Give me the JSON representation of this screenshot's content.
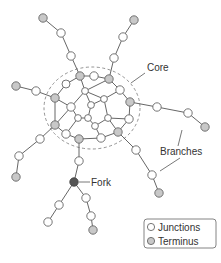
{
  "labels": {
    "core": "Core",
    "branches": "Branches",
    "fork": "Fork"
  },
  "legend": {
    "items": [
      {
        "label": "Junctions",
        "type": "junction"
      },
      {
        "label": "Terminus",
        "type": "terminus"
      }
    ]
  },
  "colors": {
    "junction_fill": "#ffffff",
    "terminus_fill": "#c8c8c8",
    "fork_fill": "#555555",
    "stroke": "#666666"
  },
  "nodes": [
    {
      "id": "t1",
      "x": 43,
      "y": 18,
      "type": "terminus"
    },
    {
      "id": "a1",
      "x": 61,
      "y": 33,
      "type": "junction"
    },
    {
      "id": "a2",
      "x": 71,
      "y": 56,
      "type": "junction"
    },
    {
      "id": "c1",
      "x": 80,
      "y": 76,
      "type": "terminus"
    },
    {
      "id": "t2",
      "x": 134,
      "y": 20,
      "type": "terminus"
    },
    {
      "id": "b1",
      "x": 123,
      "y": 37,
      "type": "junction"
    },
    {
      "id": "b2",
      "x": 114,
      "y": 58,
      "type": "junction"
    },
    {
      "id": "c2",
      "x": 109,
      "y": 79,
      "type": "terminus"
    },
    {
      "id": "c3",
      "x": 94,
      "y": 76,
      "type": "junction"
    },
    {
      "id": "t3",
      "x": 16,
      "y": 86,
      "type": "terminus"
    },
    {
      "id": "d1",
      "x": 36,
      "y": 91,
      "type": "junction"
    },
    {
      "id": "c4",
      "x": 55,
      "y": 98,
      "type": "terminus"
    },
    {
      "id": "c5",
      "x": 85,
      "y": 91,
      "type": "junction"
    },
    {
      "id": "c6",
      "x": 104,
      "y": 99,
      "type": "junction"
    },
    {
      "id": "c7",
      "x": 120,
      "y": 90,
      "type": "junction"
    },
    {
      "id": "c8",
      "x": 71,
      "y": 107,
      "type": "junction"
    },
    {
      "id": "c9",
      "x": 91,
      "y": 105,
      "type": "junction"
    },
    {
      "id": "c10",
      "x": 130,
      "y": 102,
      "type": "terminus"
    },
    {
      "id": "c11",
      "x": 78,
      "y": 118,
      "type": "junction"
    },
    {
      "id": "c12",
      "x": 88,
      "y": 118,
      "type": "junction"
    },
    {
      "id": "c13",
      "x": 108,
      "y": 118,
      "type": "junction"
    },
    {
      "id": "c14",
      "x": 55,
      "y": 125,
      "type": "terminus"
    },
    {
      "id": "c15",
      "x": 95,
      "y": 126,
      "type": "junction"
    },
    {
      "id": "c16",
      "x": 129,
      "y": 119,
      "type": "junction"
    },
    {
      "id": "c17",
      "x": 66,
      "y": 134,
      "type": "junction"
    },
    {
      "id": "c18",
      "x": 79,
      "y": 139,
      "type": "terminus"
    },
    {
      "id": "c19",
      "x": 101,
      "y": 138,
      "type": "junction"
    },
    {
      "id": "c20",
      "x": 118,
      "y": 132,
      "type": "terminus"
    },
    {
      "id": "e1",
      "x": 157,
      "y": 107,
      "type": "junction"
    },
    {
      "id": "e2",
      "x": 188,
      "y": 113,
      "type": "junction"
    },
    {
      "id": "t4",
      "x": 205,
      "y": 127,
      "type": "terminus"
    },
    {
      "id": "f1",
      "x": 40,
      "y": 139,
      "type": "junction"
    },
    {
      "id": "f2",
      "x": 19,
      "y": 156,
      "type": "junction"
    },
    {
      "id": "t5",
      "x": 16,
      "y": 177,
      "type": "terminus"
    },
    {
      "id": "g1",
      "x": 136,
      "y": 150,
      "type": "junction"
    },
    {
      "id": "g2",
      "x": 152,
      "y": 175,
      "type": "junction"
    },
    {
      "id": "t6",
      "x": 159,
      "y": 193,
      "type": "terminus"
    },
    {
      "id": "h1",
      "x": 79,
      "y": 161,
      "type": "junction"
    },
    {
      "id": "fork",
      "x": 74,
      "y": 182,
      "type": "fork"
    },
    {
      "id": "i1",
      "x": 59,
      "y": 205,
      "type": "junction"
    },
    {
      "id": "i2",
      "x": 48,
      "y": 222,
      "type": "junction"
    },
    {
      "id": "j1",
      "x": 86,
      "y": 198,
      "type": "junction"
    },
    {
      "id": "j2",
      "x": 91,
      "y": 216,
      "type": "junction"
    },
    {
      "id": "t7",
      "x": 93,
      "y": 230,
      "type": "terminus"
    }
  ]
}
